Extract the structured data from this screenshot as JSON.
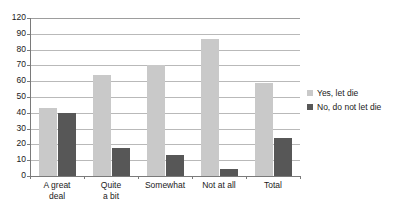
{
  "chart_data": {
    "type": "bar",
    "title": "",
    "subtitle": "",
    "xlabel": "",
    "ylabel": "",
    "categories": [
      "A great\ndeal",
      "Quite\na bit",
      "Somewhat",
      "Not at all",
      "Total"
    ],
    "series": [
      {
        "name": "Yes, let die",
        "color": "#c9c9c9",
        "values": [
          52,
          77,
          84,
          104,
          71
        ]
      },
      {
        "name": "No, do not let die",
        "color": "#575757",
        "values": [
          48,
          21,
          16,
          5,
          29
        ]
      }
    ],
    "ylim": [
      0,
      120
    ],
    "ytick_labels": [
      "120",
      "90",
      "80",
      "70",
      "60",
      "50",
      "40",
      "30",
      "20",
      "10",
      "0"
    ],
    "grid": true,
    "legend_position": "right"
  },
  "axis": {
    "ticks": [
      {
        "label": "120"
      },
      {
        "label": "90"
      },
      {
        "label": "80"
      },
      {
        "label": "70"
      },
      {
        "label": "60"
      },
      {
        "label": "50"
      },
      {
        "label": "40"
      },
      {
        "label": "30"
      },
      {
        "label": "20"
      },
      {
        "label": "10"
      },
      {
        "label": "0"
      }
    ]
  },
  "categories": [
    {
      "label": "A great\ndeal"
    },
    {
      "label": "Quite\na bit"
    },
    {
      "label": "Somewhat"
    },
    {
      "label": "Not at all"
    },
    {
      "label": "Total"
    }
  ],
  "legend": {
    "items": [
      {
        "label": "Yes, let die",
        "color": "#c9c9c9"
      },
      {
        "label": "No, do not let die",
        "color": "#575757"
      }
    ]
  },
  "colors": {
    "series_light": "#c9c9c9",
    "series_dark": "#575757",
    "gridline": "#b9b9b9",
    "axis": "#7a7a7a",
    "background": "#ffffff",
    "text": "#1a1a1a"
  }
}
